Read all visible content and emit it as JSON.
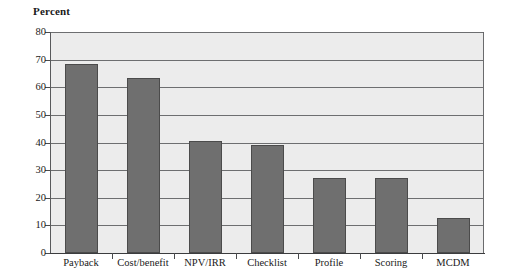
{
  "chart_data": {
    "type": "bar",
    "title": "Percent",
    "xlabel": "",
    "ylabel": "Percent",
    "categories": [
      "Payback",
      "Cost/benefit",
      "NPV/IRR",
      "Checklist",
      "Profile",
      "Scoring",
      "MCDM"
    ],
    "values": [
      68.5,
      63.5,
      40.5,
      39,
      27,
      27.3,
      12.5
    ],
    "ylim": [
      0,
      80
    ],
    "ytick_labels": [
      "0",
      "10",
      "20",
      "30",
      "40",
      "50",
      "60",
      "70",
      "80"
    ],
    "ytick_values": [
      0,
      10,
      20,
      30,
      40,
      50,
      60,
      70,
      80
    ],
    "grid": true,
    "legend": "none",
    "colors": {
      "bar_fill": "#6f6f6f",
      "bar_stroke": "#4b4b4b",
      "plot_background": "#ececec",
      "gridline": "#6d6e70",
      "axis": "#3b3c3e",
      "text": "#1a1a1a"
    }
  }
}
